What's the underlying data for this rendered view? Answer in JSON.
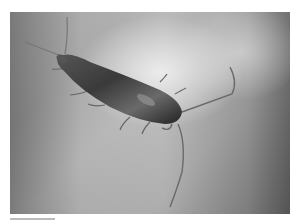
{
  "image": {
    "subject": "silverfish insect",
    "description": "Grayscale photograph of a silverfish on a gray surface, with long antennae and tail filaments",
    "colors": {
      "background": "#ffffff",
      "surface_light": "#e0e0e0",
      "surface_dark": "#8a8a8a",
      "insect_body": "#3a3a3a"
    }
  }
}
